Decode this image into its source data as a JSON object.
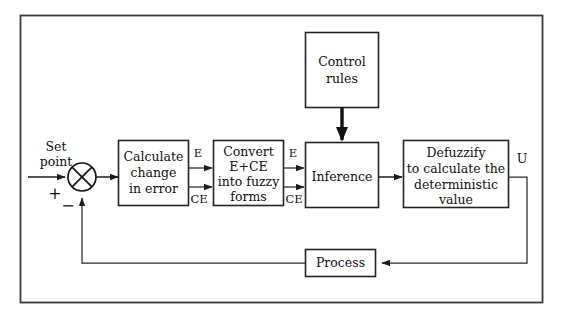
{
  "diagram": {
    "type": "block-diagram",
    "background_color": "#ffffff",
    "frame_color": "#3a3a3a",
    "line_color": "#1c1c1c",
    "text_color": "#101010"
  },
  "inputs": {
    "setpoint_line1": "Set",
    "setpoint_line2": "point",
    "plus_sign": "+",
    "minus_sign": "−"
  },
  "blocks": {
    "calculate_error": {
      "line1": "Calculate",
      "line2": "change",
      "line3": "in error"
    },
    "fuzzify": {
      "line1": "Convert",
      "line2": "E+CE",
      "line3": "into fuzzy",
      "line4": "forms"
    },
    "inference": {
      "line1": "Inference"
    },
    "control_rules": {
      "line1": "Control",
      "line2": "rules"
    },
    "defuzzify": {
      "line1": "Defuzzify",
      "line2": "to calculate the",
      "line3": "deterministic",
      "line4": "value"
    },
    "process": {
      "line1": "Process"
    }
  },
  "signals": {
    "error_1": "E",
    "change_error_1": "CE",
    "error_2": "E",
    "change_error_2": "CE",
    "output": "U"
  }
}
